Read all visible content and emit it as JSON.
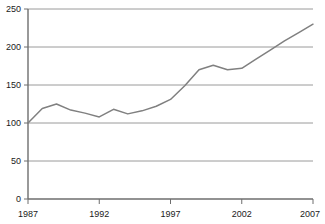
{
  "chart_data": {
    "type": "line",
    "title": "",
    "subtitle": "",
    "xlabel": "",
    "ylabel": "",
    "xlim": [
      1987,
      2007
    ],
    "ylim": [
      0,
      250
    ],
    "grid": true,
    "legend": null,
    "legend_position": "none",
    "x_ticks": [
      "1987",
      "1992",
      "1997",
      "2002",
      "2007"
    ],
    "x_tick_values": [
      1987,
      1992,
      1997,
      2002,
      2007
    ],
    "y_ticks": [
      "0",
      "50",
      "100",
      "150",
      "200",
      "250"
    ],
    "y_tick_values": [
      0,
      50,
      100,
      150,
      200,
      250
    ],
    "x": [
      1987,
      1988,
      1989,
      1990,
      1991,
      1992,
      1993,
      1994,
      1995,
      1996,
      1997,
      1998,
      1999,
      2000,
      2001,
      2002,
      2003,
      2004,
      2005,
      2006,
      2007
    ],
    "series": [
      {
        "name": "Index",
        "color": "#808080",
        "values": [
          100,
          119,
          125,
          117,
          113,
          108,
          118,
          112,
          116,
          122,
          131,
          149,
          170,
          176,
          170,
          172,
          184,
          196,
          208,
          219,
          230
        ]
      }
    ],
    "colors": {
      "line": "#808080",
      "grid": "#9a9a9a",
      "axis": "#6e6e6e",
      "text": "#1a1a1a",
      "background": "#ffffff"
    }
  }
}
